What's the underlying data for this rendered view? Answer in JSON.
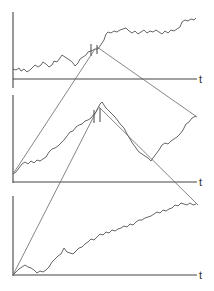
{
  "figure": {
    "colors": {
      "axis": "#444444",
      "walk": "#555555",
      "connector": "#666666",
      "background": "#ffffff"
    },
    "panels": [
      {
        "id": "top",
        "axis_label": "t",
        "y_axis": [
          13,
          12,
          13,
          88
        ],
        "x_axis": [
          13,
          79,
          197,
          79
        ],
        "label_pos": [
          199,
          83
        ],
        "walk": "M13,69 L16,70 L19,68 L21,71 L24,69 L27,72 L30,70 L33,67 L35,65 L38,67 L41,65 L43,62 L46,64 L49,67 L52,65 L54,61 L57,62 L60,58 L62,55 L65,57 L68,59 L71,61 L73,63 L75,66 L78,63 L80,59 L83,57 L86,55 L88,52 L91,51 L93,50 L95,49 L98,49 L100,46 L102,43 L104,40 L106,34 L108,32 L111,33 L114,31 L117,32 L120,30 L123,29 L126,28 L129,31 L132,33 L135,31 L138,34 L141,32 L144,30 L147,33 L150,31 L153,32 L156,30 L159,32 L162,34 L165,31 L168,33 L171,30 L174,31 L177,29 L180,27 L182,22 L185,20 L188,21 L191,19 L194,20 L196,18",
        "marks": [
          [
            91,
            44,
            91,
            56
          ],
          [
            97,
            45,
            97,
            54
          ]
        ]
      },
      {
        "id": "middle",
        "axis_label": "t",
        "y_axis": [
          13,
          95,
          13,
          183
        ],
        "x_axis": [
          13,
          182,
          197,
          182
        ],
        "label_pos": [
          199,
          186
        ],
        "walk": "M13,174 L16,172 L19,168 L22,164 L25,162 L28,164 L31,161 L34,163 L37,160 L40,161 L43,159 L46,157 L49,152 L52,149 L55,148 L58,146 L61,143 L64,140 L67,136 L70,132 L73,131 L76,127 L79,125 L82,124 L85,121 L88,120 L91,118 L94,114 L96,112 L98,108 L100,104 L102,102 L104,105 L106,108 L109,111 L112,114 L115,117 L118,121 L121,125 L124,128 L127,134 L130,139 L133,144 L136,148 L139,152 L142,154 L145,156 L148,158 L151,161 L153,158 L156,154 L159,150 L162,145 L165,143 L168,144 L171,141 L174,139 L177,137 L180,134 L183,130 L186,124 L189,122 L192,118 L196,116",
        "marks": [
          [
            94,
            110,
            94,
            123
          ],
          [
            100,
            108,
            100,
            122
          ]
        ]
      },
      {
        "id": "bottom",
        "axis_label": "t",
        "y_axis": [
          13,
          196,
          13,
          276
        ],
        "x_axis": [
          13,
          275,
          197,
          275
        ],
        "label_pos": [
          199,
          279
        ],
        "walk": "M13,275 L16,272 L19,269 L22,267 L25,265 L28,267 L31,268 L34,270 L37,273 L40,271 L43,272 L46,270 L49,267 L52,262 L55,259 L58,256 L61,254 L64,248 L67,252 L70,253 L73,254 L76,251 L79,248 L82,247 L85,244 L88,242 L91,239 L94,240 L97,237 L100,234 L103,235 L106,232 L109,233 L112,230 L115,231 L118,229 L121,228 L124,226 L127,227 L130,224 L133,225 L136,222 L139,220 L142,220 L145,218 L148,217 L151,216 L154,214 L157,212 L160,213 L163,210 L166,211 L169,209 L172,208 L175,205 L178,206 L181,203 L184,204 L187,205 L190,203 L193,205 L196,204"
      }
    ],
    "connectors": [
      {
        "id": "bottom-origin-to-middle-peak",
        "path": "M13,275 L98,108"
      },
      {
        "id": "middle-origin-to-top-peak",
        "path": "M13,174 L95,49"
      },
      {
        "id": "top-peak-to-middle-end",
        "path": "M97,47 L197,117"
      },
      {
        "id": "middle-peak-to-bottom-end",
        "path": "M99,107 L198,205"
      }
    ]
  }
}
